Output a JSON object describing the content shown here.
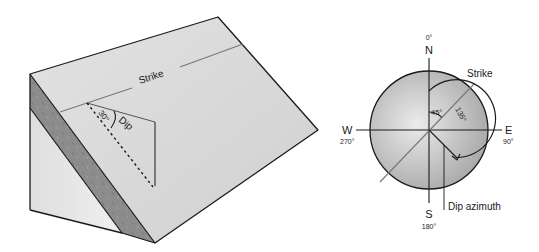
{
  "block_diagram": {
    "strike_label": "Strike",
    "dip_label": "Dip",
    "dip_angle_label": "30°"
  },
  "compass": {
    "north_label": "N",
    "north_degrees": "0°",
    "east_label": "E",
    "east_degrees": "90°",
    "south_label": "S",
    "south_degrees": "180°",
    "west_label": "W",
    "west_degrees": "270°",
    "strike_label": "Strike",
    "strike_angle_label": "45°",
    "dip_azimuth_angle_label": "135°",
    "dip_azimuth_label": "Dip azimuth"
  },
  "colors": {
    "face_light": "#e6e6e6",
    "face_top": "#dcdcdc",
    "bedding_layer": "#8a8a8a",
    "outline": "#1a1a1a",
    "strike_line": "#7a7a7a",
    "compass_fill_center": "#e4e4e4",
    "compass_fill_edge": "#a8a8a8"
  }
}
